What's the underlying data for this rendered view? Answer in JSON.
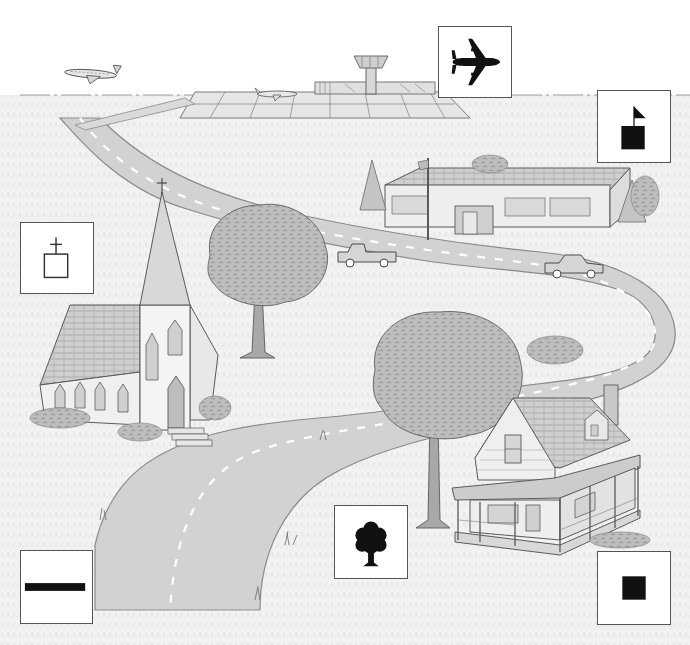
{
  "scene": {
    "type": "illustrated-map-scene",
    "style": "pencil-sketch-grayscale",
    "colors": {
      "background": "#ffffff",
      "grass": "#ececec",
      "road": "#cfcfcf",
      "road_edge": "#8a8a8a",
      "line": "#5a5a5a",
      "foliage": "#b5b5b5",
      "symbol_fill": "#111111",
      "symbol_border": "#555555"
    },
    "features": [
      {
        "name": "airport",
        "description": "runway grid with control tower, terminal, parked plane and plane in flight"
      },
      {
        "name": "school",
        "description": "long flat-roofed building with flagpole, surrounded by pine trees"
      },
      {
        "name": "church",
        "description": "church with tall steeple and cross"
      },
      {
        "name": "road",
        "description": "winding two-lane road with dashed center line and two vehicles"
      },
      {
        "name": "tree",
        "description": "large deciduous trees"
      },
      {
        "name": "house",
        "description": "two-story house with dormer and wraparound porch"
      }
    ],
    "vehicles": [
      "pickup-truck",
      "sedan"
    ]
  },
  "legend_symbols": [
    {
      "id": "airport",
      "icon": "airplane-icon",
      "box": {
        "x": 438,
        "y": 26,
        "w": 74,
        "h": 72
      }
    },
    {
      "id": "school",
      "icon": "flag-on-square-icon",
      "box": {
        "x": 597,
        "y": 90,
        "w": 74,
        "h": 73
      }
    },
    {
      "id": "church",
      "icon": "cross-on-square-icon",
      "box": {
        "x": 20,
        "y": 222,
        "w": 74,
        "h": 72
      }
    },
    {
      "id": "road",
      "icon": "thick-line-icon",
      "box": {
        "x": 20,
        "y": 550,
        "w": 73,
        "h": 74
      }
    },
    {
      "id": "tree",
      "icon": "tree-icon",
      "box": {
        "x": 334,
        "y": 505,
        "w": 74,
        "h": 74
      }
    },
    {
      "id": "house",
      "icon": "filled-square-icon",
      "box": {
        "x": 597,
        "y": 551,
        "w": 74,
        "h": 74
      }
    }
  ]
}
